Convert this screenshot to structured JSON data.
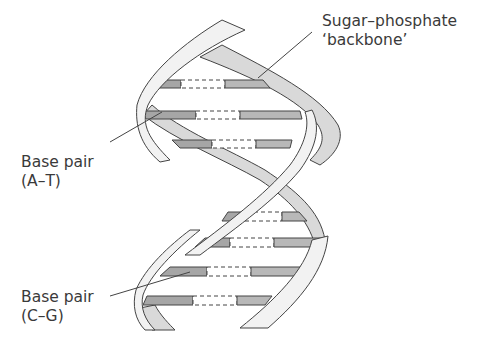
{
  "diagram": {
    "labels": {
      "backbone_line1": "Sugar–phosphate",
      "backbone_line2": "‘backbone’",
      "base_pair_at_line1": "Base pair",
      "base_pair_at_line2": "(A–T)",
      "base_pair_cg_line1": "Base pair",
      "base_pair_cg_line2": "(C–G)"
    },
    "components": [
      {
        "name": "Sugar-phosphate backbone",
        "shape": "twisted ribbon (two strands)"
      },
      {
        "name": "Base pair (A-T)",
        "shape": "horizontal rung with dashed hydrogen bonds"
      },
      {
        "name": "Base pair (C-G)",
        "shape": "horizontal rung with dashed hydrogen bonds"
      }
    ],
    "base_pair_rungs": 8,
    "colors": {
      "back_strand": "#d9d9d9",
      "front_strand": "#f2f2f2",
      "base_dark": "#a6a6a6",
      "base_light": "#b8b8b8",
      "outline": "#444444",
      "text": "#3a3a3a"
    }
  }
}
